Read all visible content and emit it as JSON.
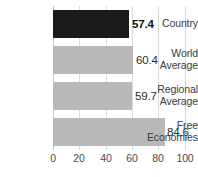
{
  "chart_data": {
    "type": "bar",
    "orientation": "horizontal",
    "title": "",
    "xlabel": "",
    "ylabel": "",
    "xlim": [
      0,
      100
    ],
    "grid": true,
    "legend": "none",
    "categories": [
      "Country",
      "World Average",
      "Regional Average",
      "Free Economies"
    ],
    "values": [
      57.4,
      59.7,
      60.4,
      84.6
    ],
    "series": [
      {
        "name": "score",
        "points": [
          {
            "category": "Country",
            "label_lines": [
              "Country"
            ],
            "value": 57.4,
            "value_label": "57.4",
            "color": "#1b1b1b",
            "emphasis": true
          },
          {
            "category": "World Average",
            "label_lines": [
              "World",
              "Average"
            ],
            "value": 60.4,
            "value_label": "60.4",
            "color": "#b9b9b9",
            "emphasis": false
          },
          {
            "category": "Regional Average",
            "label_lines": [
              "Regional",
              "Average"
            ],
            "value": 59.7,
            "value_label": "59.7",
            "color": "#b9b9b9",
            "emphasis": false
          },
          {
            "category": "Free Economies",
            "label_lines": [
              "Free",
              "Economies"
            ],
            "value": 84.6,
            "value_label": "84.6",
            "color": "#b9b9b9",
            "emphasis": false
          }
        ]
      }
    ],
    "xticks": [
      "0",
      "20",
      "40",
      "60",
      "80",
      "100"
    ],
    "colors": {
      "emphasis_bar": "#1b1b1b",
      "bar": "#b9b9b9",
      "grid": "#d9d9d9",
      "text": "#3b3b3b"
    }
  },
  "rows": [
    {
      "l1": "Country",
      "l2": "",
      "value_label": "57.4"
    },
    {
      "l1": "World",
      "l2": "Average",
      "value_label": "60.4"
    },
    {
      "l1": "Regional",
      "l2": "Average",
      "value_label": "59.7"
    },
    {
      "l1": "Free",
      "l2": "Economies",
      "value_label": "84.6"
    }
  ],
  "axis": {
    "t0": "0",
    "t1": "20",
    "t2": "40",
    "t3": "60",
    "t4": "80",
    "t5": "100"
  }
}
